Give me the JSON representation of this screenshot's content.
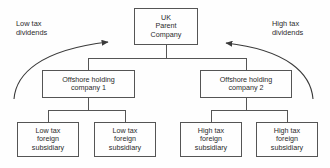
{
  "diagram": {
    "type": "organisational-flow",
    "title": "",
    "stroke_color": "#555555",
    "text_color": "#2b2b2b",
    "background": "#fefefe",
    "nodes": {
      "parent": {
        "lines": [
          "UK",
          "Parent",
          "Company"
        ]
      },
      "offshore_1": {
        "lines": [
          "Offshore holding",
          "company 1"
        ]
      },
      "offshore_2": {
        "lines": [
          "Offshore holding",
          "company 2"
        ]
      },
      "subsidiary_1": {
        "lines": [
          "Low tax",
          "foreign",
          "subsidiary"
        ]
      },
      "subsidiary_2": {
        "lines": [
          "Low tax",
          "foreign",
          "subsidiary"
        ]
      },
      "subsidiary_3": {
        "lines": [
          "High tax",
          "foreign",
          "subsidiary"
        ]
      },
      "subsidiary_4": {
        "lines": [
          "High tax",
          "foreign",
          "subsidiary"
        ]
      }
    },
    "annotations": {
      "left_flow": {
        "lines": [
          "Low tax",
          "dividends"
        ]
      },
      "right_flow": {
        "lines": [
          "High tax",
          "dividends"
        ]
      }
    }
  }
}
